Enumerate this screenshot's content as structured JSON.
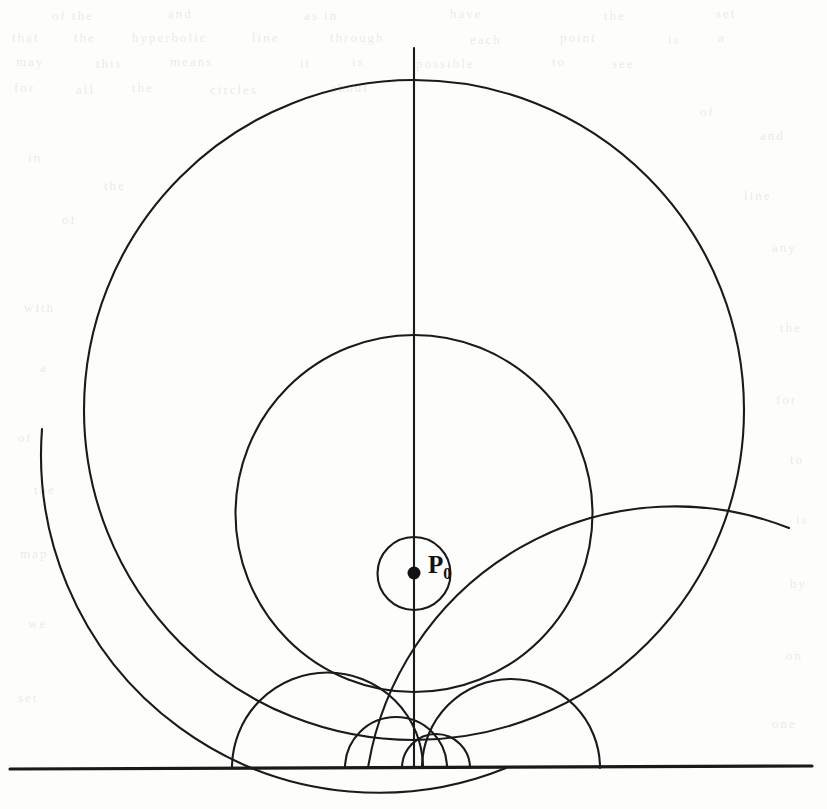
{
  "figure": {
    "label_point": "P",
    "label_point_sub": "0",
    "background_color": "#fdfdfb",
    "stroke_color": "#1a1a1a"
  },
  "chart_data": {
    "type": "diagram",
    "model": "Poincare upper half-plane",
    "center_point": {
      "name": "P0",
      "x": 414,
      "y": 573
    },
    "boundary_line": {
      "name": "ideal-boundary",
      "y": 768,
      "x_start": 10,
      "x_end": 812
    },
    "vertical_geodesic": {
      "x": 414,
      "y_top": 48,
      "y_bottom": 768
    },
    "hyperbolic_circles": [
      {
        "name": "circle-1",
        "top_y": 537,
        "bottom_y": 610,
        "center_x": 414,
        "center_y": 573.5,
        "radius": 36.5
      },
      {
        "name": "circle-2",
        "top_y": 335,
        "bottom_y": 692,
        "center_x": 414,
        "center_y": 513.5,
        "radius": 178.5
      },
      {
        "name": "circle-3",
        "top_y": 80,
        "bottom_y": 740,
        "center_x": 414,
        "center_y": 410,
        "radius": 330
      }
    ],
    "geodesic_rays": [
      {
        "name": "ray-steep-left",
        "foot_x": 345,
        "center_x": 396.0,
        "radius": 51.0
      },
      {
        "name": "ray-steep-right",
        "foot_x": 470,
        "center_x": 436.0,
        "radius": 34.0
      },
      {
        "name": "ray-mid-left",
        "foot_x": 232,
        "center_x": 327.5,
        "radius": 95.5
      },
      {
        "name": "ray-mid-right",
        "foot_x": 600,
        "center_x": 511.0,
        "radius": 89.0
      },
      {
        "name": "ray-shallow-left",
        "foot_x": -170,
        "center_x": 168.0,
        "radius": 338.0
      },
      {
        "name": "ray-shallow-right",
        "foot_x": 990,
        "center_x": 679.0,
        "radius": 311.0
      }
    ],
    "axis_ranges": {
      "x": [
        0,
        827
      ],
      "y": [
        0,
        809
      ]
    },
    "grid": false,
    "legend": "none"
  },
  "ghost_text": {
    "note": "faint show-through text from the opposite side of the printed page",
    "lines": [
      {
        "text": "of the",
        "x": 52,
        "y": 8,
        "size": 13
      },
      {
        "text": "and",
        "x": 168,
        "y": 6,
        "size": 13
      },
      {
        "text": "as in",
        "x": 304,
        "y": 8,
        "size": 13
      },
      {
        "text": "have",
        "x": 450,
        "y": 6,
        "size": 13
      },
      {
        "text": "the",
        "x": 604,
        "y": 8,
        "size": 13
      },
      {
        "text": "set",
        "x": 716,
        "y": 6,
        "size": 13
      },
      {
        "text": "that",
        "x": 12,
        "y": 30,
        "size": 13
      },
      {
        "text": "the",
        "x": 74,
        "y": 30,
        "size": 13
      },
      {
        "text": "hyperbolic",
        "x": 132,
        "y": 30,
        "size": 13
      },
      {
        "text": "line",
        "x": 252,
        "y": 30,
        "size": 13
      },
      {
        "text": "through",
        "x": 330,
        "y": 30,
        "size": 13
      },
      {
        "text": "each",
        "x": 470,
        "y": 32,
        "size": 13
      },
      {
        "text": "point",
        "x": 560,
        "y": 30,
        "size": 13
      },
      {
        "text": "is",
        "x": 668,
        "y": 32,
        "size": 13
      },
      {
        "text": "a",
        "x": 718,
        "y": 30,
        "size": 13
      },
      {
        "text": "may",
        "x": 16,
        "y": 54,
        "size": 13
      },
      {
        "text": "this",
        "x": 96,
        "y": 56,
        "size": 13
      },
      {
        "text": "means",
        "x": 170,
        "y": 54,
        "size": 13
      },
      {
        "text": "it",
        "x": 300,
        "y": 56,
        "size": 13
      },
      {
        "text": "is",
        "x": 352,
        "y": 54,
        "size": 13
      },
      {
        "text": "possible",
        "x": 416,
        "y": 56,
        "size": 13
      },
      {
        "text": "to",
        "x": 552,
        "y": 54,
        "size": 13
      },
      {
        "text": "see",
        "x": 612,
        "y": 56,
        "size": 13
      },
      {
        "text": "for",
        "x": 14,
        "y": 80,
        "size": 13
      },
      {
        "text": "all",
        "x": 76,
        "y": 82,
        "size": 13
      },
      {
        "text": "the",
        "x": 132,
        "y": 80,
        "size": 13
      },
      {
        "text": "circles",
        "x": 210,
        "y": 82,
        "size": 13
      },
      {
        "text": "about",
        "x": 330,
        "y": 80,
        "size": 13
      },
      {
        "text": "of",
        "x": 700,
        "y": 104,
        "size": 13
      },
      {
        "text": "and",
        "x": 760,
        "y": 128,
        "size": 13
      },
      {
        "text": "in",
        "x": 28,
        "y": 150,
        "size": 13
      },
      {
        "text": "the",
        "x": 104,
        "y": 178,
        "size": 13
      },
      {
        "text": "line",
        "x": 744,
        "y": 188,
        "size": 13
      },
      {
        "text": "of",
        "x": 62,
        "y": 212,
        "size": 13
      },
      {
        "text": "any",
        "x": 772,
        "y": 240,
        "size": 13
      },
      {
        "text": "with",
        "x": 24,
        "y": 300,
        "size": 13
      },
      {
        "text": "the",
        "x": 780,
        "y": 320,
        "size": 13
      },
      {
        "text": "a",
        "x": 40,
        "y": 360,
        "size": 13
      },
      {
        "text": "for",
        "x": 776,
        "y": 392,
        "size": 13
      },
      {
        "text": "of",
        "x": 18,
        "y": 430,
        "size": 13
      },
      {
        "text": "to",
        "x": 790,
        "y": 452,
        "size": 13
      },
      {
        "text": "the",
        "x": 34,
        "y": 482,
        "size": 13
      },
      {
        "text": "is",
        "x": 796,
        "y": 512,
        "size": 13
      },
      {
        "text": "map",
        "x": 20,
        "y": 546,
        "size": 13
      },
      {
        "text": "by",
        "x": 790,
        "y": 576,
        "size": 13
      },
      {
        "text": "we",
        "x": 28,
        "y": 616,
        "size": 13
      },
      {
        "text": "on",
        "x": 786,
        "y": 648,
        "size": 13
      },
      {
        "text": "set",
        "x": 18,
        "y": 690,
        "size": 13
      },
      {
        "text": "one",
        "x": 772,
        "y": 716,
        "size": 13
      }
    ]
  }
}
